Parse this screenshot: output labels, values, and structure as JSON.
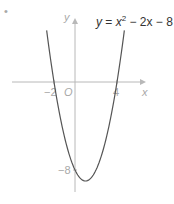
{
  "chart_data": {
    "type": "line",
    "title_parts": {
      "lhs": "y",
      "eq": " = ",
      "x": "x",
      "exp": "2",
      "rest": " − 2x − 8"
    },
    "function": {
      "a": 1,
      "b": -2,
      "c": -8
    },
    "x_domain": [
      -2.7,
      4.7
    ],
    "xlabel": "x",
    "ylabel": "y",
    "origin_label": "O",
    "x_ticks": [
      {
        "value": -2,
        "label": "−2"
      },
      {
        "value": 4,
        "label": "4"
      }
    ],
    "y_ticks": [
      {
        "value": -8,
        "label": "−8"
      }
    ],
    "roots": [
      -2,
      4
    ],
    "y_intercept": -8,
    "vertex": [
      1,
      -9
    ],
    "grid": false,
    "colors": {
      "curve": "#555555",
      "axis": "#b8b8b8",
      "labels": "#a8a8a8",
      "title": "#333333"
    }
  },
  "marker": "•"
}
